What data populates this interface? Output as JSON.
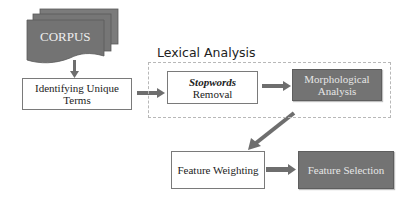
{
  "diagram": {
    "corpus": {
      "label": "CORPUS"
    },
    "identify": {
      "label_line1": "Identifying Unique",
      "label_line2": "Terms"
    },
    "lexical": {
      "title": "Lexical Analysis",
      "stopwords": {
        "label_italic": "Stopwords",
        "label_rest": "Removal"
      },
      "morph": {
        "label_line1": "Morphological",
        "label_line2": "Analysis"
      }
    },
    "weighting": {
      "label": "Feature Weighting"
    },
    "selection": {
      "label": "Feature Selection"
    }
  },
  "colors": {
    "dark_fill": "#737373",
    "arrow": "#6e6e6e",
    "border": "#7a7a7a",
    "dashed": "#b8b8b8"
  }
}
